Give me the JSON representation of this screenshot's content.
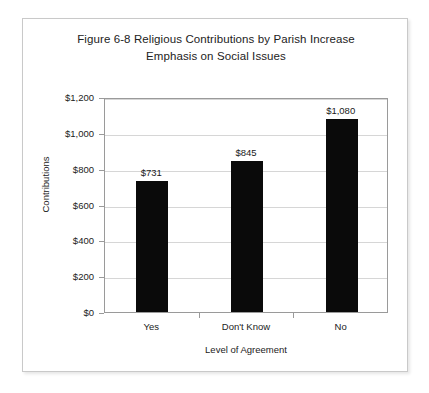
{
  "chart_data": {
    "type": "bar",
    "title": "Figure 6-8 Religious Contributions by Parish Increase Emphasis on Social Issues",
    "title_lines": [
      "Figure 6-8 Religious Contributions by Parish Increase",
      "Emphasis on Social Issues"
    ],
    "xlabel": "Level of Agreement",
    "ylabel": "Contributions",
    "categories": [
      "Yes",
      "Don't Know",
      "No"
    ],
    "values": [
      731,
      845,
      1080
    ],
    "value_labels": [
      "$731",
      "$845",
      "$1,080"
    ],
    "ylim": [
      0,
      1200
    ],
    "ytick_values": [
      0,
      200,
      400,
      600,
      800,
      1000,
      1200
    ],
    "ytick_labels": [
      "$0",
      "$200",
      "$400",
      "$600",
      "$800",
      "$1,000",
      "$1,200"
    ],
    "grid": true,
    "legend": "none",
    "bar_color": "#0a0a0a",
    "gridline_color": "#d6d6d6",
    "axis_color": "#9a9a9a",
    "background_color": "#ffffff"
  }
}
